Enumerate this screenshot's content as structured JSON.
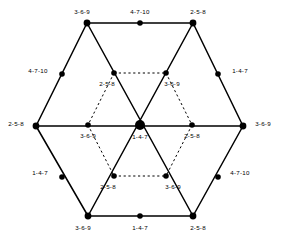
{
  "figure": {
    "type": "lattice-diagram",
    "width": 281,
    "height": 238,
    "background_color": "#ffffff",
    "line_color": "#000000",
    "node_color": "#000000",
    "outer_edge_style": "solid",
    "inner_edge_style": "dashed",
    "nodes": [
      {
        "id": "n1",
        "name": "outer-top-left-vertex",
        "x": 87,
        "y": 23,
        "r": 3.4,
        "label": "3-6-9",
        "label_x": 82,
        "label_y": 12,
        "label_anchor": "center"
      },
      {
        "id": "n2",
        "name": "outer-top-midpoint",
        "x": 140,
        "y": 23,
        "r": 2.8,
        "label": "4-7-10",
        "label_x": 140,
        "label_y": 12,
        "label_anchor": "center"
      },
      {
        "id": "n3",
        "name": "outer-top-right-vertex",
        "x": 193,
        "y": 23,
        "r": 3.4,
        "label": "2-5-8",
        "label_x": 198,
        "label_y": 12,
        "label_anchor": "center"
      },
      {
        "id": "n4",
        "name": "outer-upper-left-edge",
        "x": 62,
        "y": 74,
        "r": 2.8,
        "label": "4-7-10",
        "label_x": 38,
        "label_y": 71,
        "label_anchor": "center"
      },
      {
        "id": "n5",
        "name": "outer-upper-right-edge",
        "x": 218,
        "y": 74,
        "r": 2.8,
        "label": "1-4-7",
        "label_x": 240,
        "label_y": 71,
        "label_anchor": "center"
      },
      {
        "id": "n6",
        "name": "inner-top-left-node",
        "x": 114,
        "y": 73,
        "r": 2.8,
        "label": "2-5-8",
        "label_x": 107,
        "label_y": 84,
        "label_anchor": "center"
      },
      {
        "id": "n7",
        "name": "inner-top-right-node",
        "x": 166,
        "y": 73,
        "r": 2.8,
        "label": "3-6-9",
        "label_x": 172,
        "label_y": 84,
        "label_anchor": "center"
      },
      {
        "id": "n8",
        "name": "outer-left-vertex",
        "x": 36,
        "y": 126,
        "r": 3.4,
        "label": "2-5-8",
        "label_x": 16,
        "label_y": 124,
        "label_anchor": "center"
      },
      {
        "id": "n9",
        "name": "inner-left-node",
        "x": 88,
        "y": 125,
        "r": 2.8,
        "label": "3-6-9",
        "label_x": 88,
        "label_y": 136,
        "label_anchor": "center"
      },
      {
        "id": "n10",
        "name": "center-node",
        "x": 140,
        "y": 125,
        "r": 5.0,
        "label": "1-4-7",
        "label_x": 140,
        "label_y": 137,
        "label_anchor": "center"
      },
      {
        "id": "n11",
        "name": "inner-right-node",
        "x": 192,
        "y": 125,
        "r": 2.8,
        "label": "2-5-8",
        "label_x": 192,
        "label_y": 136,
        "label_anchor": "center"
      },
      {
        "id": "n12",
        "name": "outer-right-vertex",
        "x": 243,
        "y": 126,
        "r": 3.4,
        "label": "3-6-9",
        "label_x": 263,
        "label_y": 124,
        "label_anchor": "center"
      },
      {
        "id": "n13",
        "name": "outer-lower-left-edge",
        "x": 62,
        "y": 177,
        "r": 2.8,
        "label": "1-4-7",
        "label_x": 40,
        "label_y": 173,
        "label_anchor": "center"
      },
      {
        "id": "n14",
        "name": "inner-bottom-left-node",
        "x": 114,
        "y": 176,
        "r": 2.8,
        "label": "2-5-8",
        "label_x": 108,
        "label_y": 187,
        "label_anchor": "center"
      },
      {
        "id": "n15",
        "name": "inner-bottom-right-node",
        "x": 166,
        "y": 176,
        "r": 2.8,
        "label": "3-6-9",
        "label_x": 173,
        "label_y": 187,
        "label_anchor": "center"
      },
      {
        "id": "n16",
        "name": "outer-lower-right-edge",
        "x": 218,
        "y": 177,
        "r": 2.8,
        "label": "4-7-10",
        "label_x": 240,
        "label_y": 173,
        "label_anchor": "center"
      },
      {
        "id": "n17",
        "name": "outer-bottom-left-vertex",
        "x": 88,
        "y": 216,
        "r": 3.4,
        "label": "3-6-9",
        "label_x": 83,
        "label_y": 228,
        "label_anchor": "center"
      },
      {
        "id": "n18",
        "name": "outer-bottom-midpoint",
        "x": 140,
        "y": 216,
        "r": 2.8,
        "label": "1-4-7",
        "label_x": 140,
        "label_y": 228,
        "label_anchor": "center"
      },
      {
        "id": "n19",
        "name": "outer-bottom-right-vertex",
        "x": 193,
        "y": 216,
        "r": 3.4,
        "label": "2-5-8",
        "label_x": 198,
        "label_y": 228,
        "label_anchor": "center"
      }
    ],
    "solid_edges": [
      {
        "name": "edge-top",
        "x1": 87,
        "y1": 23,
        "x2": 193,
        "y2": 23
      },
      {
        "name": "edge-upper-left",
        "x1": 87,
        "y1": 23,
        "x2": 36,
        "y2": 126
      },
      {
        "name": "edge-upper-right",
        "x1": 193,
        "y1": 23,
        "x2": 243,
        "y2": 126
      },
      {
        "name": "edge-lower-left",
        "x1": 36,
        "y1": 126,
        "x2": 88,
        "y2": 216
      },
      {
        "name": "edge-lower-right",
        "x1": 243,
        "y1": 126,
        "x2": 193,
        "y2": 216
      },
      {
        "name": "edge-bottom",
        "x1": 88,
        "y1": 216,
        "x2": 193,
        "y2": 216
      },
      {
        "name": "edge-horizontal-mid",
        "x1": 36,
        "y1": 126,
        "x2": 243,
        "y2": 126
      },
      {
        "name": "edge-tl-to-bottom-r",
        "x1": 87,
        "y1": 23,
        "x2": 193,
        "y2": 216
      },
      {
        "name": "edge-tr-to-bottom-l",
        "x1": 193,
        "y1": 23,
        "x2": 88,
        "y2": 216
      }
    ],
    "dashed_edges": [
      {
        "name": "inner-edge-top",
        "x1": 114,
        "y1": 73,
        "x2": 166,
        "y2": 73
      },
      {
        "name": "inner-edge-upper-left",
        "x1": 114,
        "y1": 73,
        "x2": 88,
        "y2": 125
      },
      {
        "name": "inner-edge-upper-right",
        "x1": 166,
        "y1": 73,
        "x2": 192,
        "y2": 125
      },
      {
        "name": "inner-edge-lower-left",
        "x1": 88,
        "y1": 125,
        "x2": 114,
        "y2": 176
      },
      {
        "name": "inner-edge-lower-right",
        "x1": 192,
        "y1": 125,
        "x2": 166,
        "y2": 176
      },
      {
        "name": "inner-edge-bottom",
        "x1": 114,
        "y1": 176,
        "x2": 166,
        "y2": 176
      }
    ]
  }
}
